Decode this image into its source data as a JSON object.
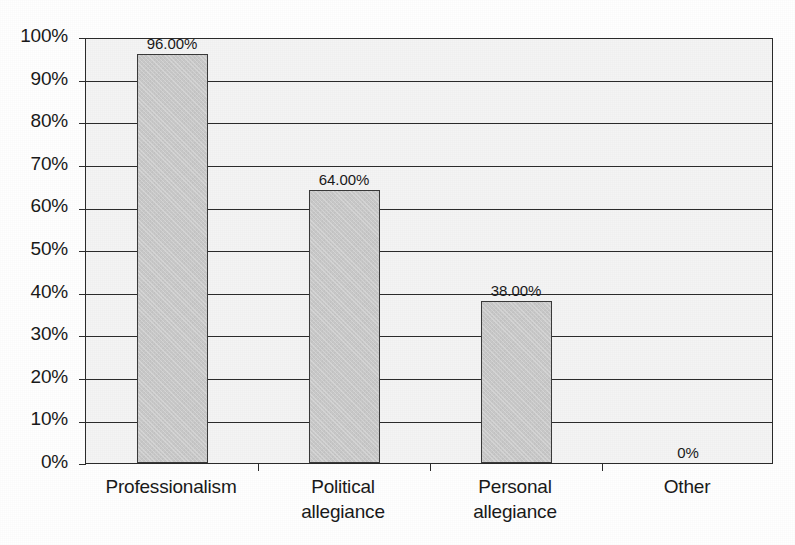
{
  "chart_data": {
    "type": "bar",
    "title": "",
    "subtitle": "",
    "xlabel": "",
    "ylabel": "",
    "categories": [
      "Professionalism",
      "Political\nallegiance",
      "Personal\nallegiance",
      "Other"
    ],
    "values": [
      96.0,
      64.0,
      38.0,
      0.0
    ],
    "value_labels": [
      "96.00%",
      "64.00%",
      "38.00%",
      "0%"
    ],
    "ylim": [
      0,
      100
    ],
    "ytick_values": [
      0,
      10,
      20,
      30,
      40,
      50,
      60,
      70,
      80,
      90,
      100
    ],
    "ytick_labels": [
      "0%",
      "10%",
      "20%",
      "30%",
      "40%",
      "50%",
      "60%",
      "70%",
      "80%",
      "90%",
      "100%"
    ],
    "grid": true,
    "grid_axis": "y",
    "legend": false,
    "legend_position": "none",
    "annotations": [],
    "series": [
      {
        "name": "",
        "values": [
          96.0,
          64.0,
          38.0,
          0.0
        ]
      }
    ]
  },
  "style": {
    "bar_fill": "#c9c9c9",
    "bar_border": "#3a3a3a",
    "plot_background": "#f4f4f4",
    "axis_color": "#2b2b2b",
    "text_color": "#1a1a1a",
    "page_background": "#ffffff"
  }
}
